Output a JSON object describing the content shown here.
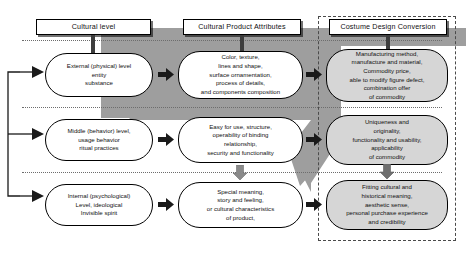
{
  "diagram": {
    "colors": {
      "band_gray": "#9e9e9e",
      "node_shade": "#d6d6d6",
      "node_white": "#ffffff",
      "line_black": "#000000",
      "arrow_black": "#1a1a1a",
      "arrow_gray": "#8a8a8a",
      "dashed_border": "#4a4a4a",
      "dotted_separator": "#6d6d6d"
    },
    "columns": [
      {
        "id": "cultural-level",
        "header": "Cultural level"
      },
      {
        "id": "cultural-product-attributes",
        "header": "Cultural Product Attributes"
      },
      {
        "id": "costume-design-conversion",
        "header": "Costume Design Conversion"
      }
    ],
    "rows": [
      {
        "id": "row-external",
        "cells": [
          {
            "id": "external-physical-level",
            "style": "white",
            "text": "External (physical) level\nentity\nsubstance"
          },
          {
            "id": "color-texture-attributes",
            "style": "white",
            "text": "Color, texture,\nlines and shape,\nsurface ornamentation,\nprocess of details,\nand components composition"
          },
          {
            "id": "manufacturing-method",
            "style": "shade",
            "text": "Manufacturing method,\nmanufacture and material,\nCommodity price,\nable to modify figure defect,\ncombination offer\nof commodity"
          }
        ]
      },
      {
        "id": "row-middle",
        "cells": [
          {
            "id": "middle-behavior-level",
            "style": "white",
            "text": "Middle (behavior) level,\nusage behavior\nritual practices"
          },
          {
            "id": "easy-for-use-structure",
            "style": "white",
            "text": "Easy for use, structure,\noperability of binding\nrelationship,\nsecurity and functionality"
          },
          {
            "id": "uniqueness-and-originality",
            "style": "shade",
            "text": "Uniqueness and\noriginality,\nfunctionality and usability,\napplicability\nof commodity"
          }
        ]
      },
      {
        "id": "row-internal",
        "cells": [
          {
            "id": "internal-psychological-level",
            "style": "white",
            "text": "Internal (psychological)\nLevel, ideological\nInvisible spirit"
          },
          {
            "id": "special-meaning-story",
            "style": "white",
            "text": "Special meaning,\nstory and feeling,\nor cultural characteristics\nof product,"
          },
          {
            "id": "fitting-cultural-historical",
            "style": "shade",
            "text": "Fitting cultural and\nhistorical meaning,\naesthetic sense,\npersonal purchase experience\nand credibility"
          }
        ]
      }
    ]
  }
}
